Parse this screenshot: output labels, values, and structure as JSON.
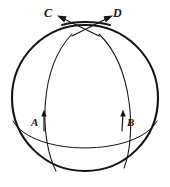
{
  "figure": {
    "type": "geometry-diagram",
    "background_color": "#ffffff",
    "stroke_color": "#141414",
    "labels": {
      "c": "C",
      "d": "D",
      "a": "A",
      "b": "B"
    },
    "label_positions": {
      "c": {
        "x": 48,
        "y": 13
      },
      "d": {
        "x": 117,
        "y": 13
      },
      "a": {
        "x": 36,
        "y": 123
      },
      "b": {
        "x": 130,
        "y": 123
      }
    },
    "sphere": {
      "name": "sphere-outline",
      "center_x": 85,
      "center_y": 98,
      "radius": 73,
      "stroke_width": 2.1
    },
    "equator": {
      "name": "equator-ellipse",
      "left_x": 13,
      "right_x": 157,
      "y": 122,
      "sag": 34,
      "stroke_width": 1.0
    },
    "meridian_left": {
      "name": "meridian-arc-left",
      "bottom_x": 56,
      "bottom_y": 171,
      "top_x": 107,
      "top_y": 20,
      "stroke_width": 1.0
    },
    "meridian_right": {
      "name": "meridian-arc-right",
      "bottom_x": 124,
      "bottom_y": 168,
      "top_x": 62,
      "top_y": 20,
      "stroke_width": 1.0
    },
    "vector_a": {
      "name": "tangent-vector-a",
      "tail_x": 44,
      "tail_y": 131,
      "tip_x": 44,
      "tip_y": 110,
      "direction": "up"
    },
    "vector_b": {
      "name": "tangent-vector-b",
      "tail_x": 122,
      "tail_y": 131,
      "tip_x": 123,
      "tip_y": 110,
      "direction": "up"
    },
    "vector_c": {
      "name": "tangent-vector-c",
      "tail_x": 99,
      "tail_y": 36,
      "tip_x": 58,
      "tip_y": 16,
      "direction": "up-left"
    },
    "vector_d": {
      "name": "tangent-vector-d",
      "tail_x": 72,
      "tail_y": 36,
      "tip_x": 111,
      "tip_y": 16,
      "direction": "up-right"
    }
  }
}
